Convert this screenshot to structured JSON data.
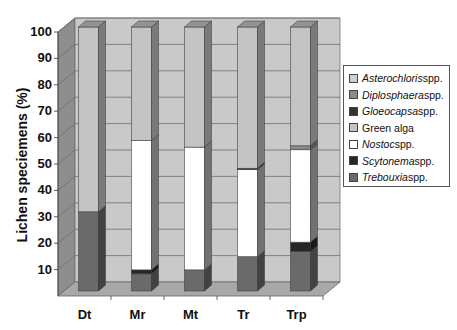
{
  "chart_data": {
    "type": "bar",
    "stacked": true,
    "three_d": true,
    "title": "",
    "xlabel": "",
    "ylabel": "Lichen speciemens (%)",
    "ylim": [
      0,
      100
    ],
    "yticks": [
      10,
      20,
      30,
      40,
      50,
      60,
      70,
      80,
      90,
      100
    ],
    "grid": true,
    "legend_position": "right",
    "categories": [
      "Dt",
      "Mr",
      "Mt",
      "Tr",
      "Trp"
    ],
    "series": [
      {
        "name": "Trebouxia",
        "suffix": " spp.",
        "italic": true,
        "color": "#6a6a6a",
        "values": [
          30,
          6.5,
          8,
          13,
          15
        ]
      },
      {
        "name": "Scytonema",
        "suffix": " spp.",
        "italic": true,
        "color": "#262626",
        "values": [
          0,
          1.5,
          0,
          0,
          3.5
        ]
      },
      {
        "name": "Nostoc",
        "suffix": " spp.",
        "italic": true,
        "color": "#ffffff",
        "values": [
          0,
          49,
          46.5,
          33,
          35
        ]
      },
      {
        "name": "Green alga",
        "suffix": "",
        "italic": false,
        "color": "#c4c4c4",
        "values": [
          70,
          43,
          45.5,
          53.5,
          45
        ]
      },
      {
        "name": "Gloeocapsa",
        "suffix": " spp.",
        "italic": true,
        "color": "#333333",
        "values": [
          0,
          0,
          0,
          0.5,
          0
        ]
      },
      {
        "name": "Diplosphaera",
        "suffix": " spp.",
        "italic": true,
        "color": "#8a8a8a",
        "values": [
          0,
          0,
          0,
          0,
          1.5
        ]
      },
      {
        "name": "Asterochloris",
        "suffix": " spp.",
        "italic": true,
        "color": "#cfcfcf",
        "values": [
          0,
          0,
          0,
          0,
          0
        ]
      }
    ],
    "legend_order": [
      "Asterochloris",
      "Diplosphaera",
      "Gloeocapsa",
      "Green alga",
      "Nostoc",
      "Scytonema",
      "Trebouxia"
    ],
    "stack_order_bottom_to_top": [
      "Trebouxia",
      "Scytonema",
      "Nostoc",
      "Gloeocapsa",
      "Diplosphaera",
      "Green alga"
    ]
  },
  "colors": {
    "back_wall": "#c9c9c9",
    "side_wall": "#8e8e8e",
    "floor": "#a8a8a8",
    "gridline": "#6e6e6e"
  }
}
